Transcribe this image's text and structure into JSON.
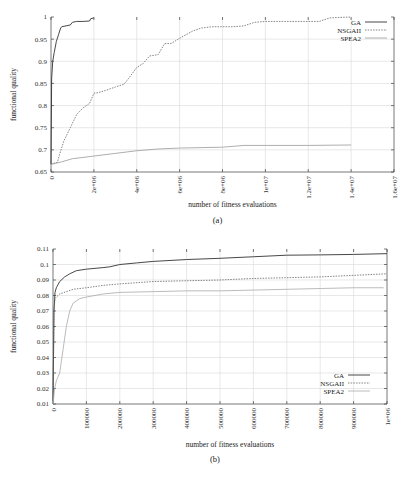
{
  "chart_data": [
    {
      "type": "line",
      "panel": "(a)",
      "caption": "(a)",
      "title": "",
      "xlabel": "number of fitness evaluations",
      "ylabel": "functional quality",
      "xlim": [
        0,
        16000000
      ],
      "ylim": [
        0.65,
        1.0
      ],
      "grid": true,
      "legend": "top-right",
      "x_ticks": [
        0,
        2000000,
        4000000,
        6000000,
        8000000,
        10000000,
        12000000,
        14000000,
        16000000
      ],
      "x_tick_labels": [
        "0",
        "2e+06",
        "4e+06",
        "6e+06",
        "8e+06",
        "1e+07",
        "1.2e+07",
        "1.4e+07",
        "1.6e+07"
      ],
      "y_ticks": [
        0.65,
        0.7,
        0.75,
        0.8,
        0.85,
        0.9,
        0.95,
        1.0
      ],
      "y_tick_labels": [
        "0.65",
        "0.7",
        "0.75",
        "0.8",
        "0.85",
        "0.9",
        "0.95",
        "1"
      ],
      "series": [
        {
          "name": "GA",
          "style": "solid",
          "color": "#333333",
          "x": [
            0,
            30000,
            80000,
            150000,
            250000,
            350000,
            450000,
            500000,
            700000,
            900000,
            1000000,
            1200000,
            1500000,
            1800000,
            1850000,
            2000000
          ],
          "y": [
            0.668,
            0.86,
            0.9,
            0.92,
            0.945,
            0.96,
            0.975,
            0.978,
            0.98,
            0.982,
            0.988,
            0.99,
            0.99,
            0.991,
            0.996,
            0.998
          ]
        },
        {
          "name": "NSGAII",
          "style": "dashed",
          "color": "#666666",
          "x": [
            0,
            300000,
            400000,
            600000,
            900000,
            1200000,
            1500000,
            1800000,
            2000000,
            2200000,
            2600000,
            3000000,
            3400000,
            3600000,
            4000000,
            4300000,
            4600000,
            5000000,
            5300000,
            5600000,
            6000000,
            6300000,
            6600000,
            7000000,
            7500000,
            8000000,
            8500000,
            9000000,
            9500000,
            10000000,
            12000000,
            12500000,
            13000000,
            14000000
          ],
          "y": [
            0.668,
            0.672,
            0.69,
            0.72,
            0.75,
            0.78,
            0.795,
            0.805,
            0.828,
            0.829,
            0.835,
            0.842,
            0.848,
            0.86,
            0.886,
            0.895,
            0.912,
            0.915,
            0.94,
            0.94,
            0.952,
            0.96,
            0.968,
            0.975,
            0.978,
            0.978,
            0.978,
            0.98,
            0.988,
            0.99,
            0.99,
            0.99,
            0.998,
            1.0
          ]
        },
        {
          "name": "SPEA2",
          "style": "solid-light",
          "color": "#999999",
          "x": [
            0,
            500000,
            1000000,
            2000000,
            3000000,
            4000000,
            5000000,
            6000000,
            7000000,
            8000000,
            8500000,
            9000000,
            10000000,
            12000000,
            14000000
          ],
          "y": [
            0.667,
            0.673,
            0.68,
            0.686,
            0.692,
            0.698,
            0.702,
            0.704,
            0.705,
            0.706,
            0.708,
            0.71,
            0.71,
            0.71,
            0.711
          ]
        }
      ]
    },
    {
      "type": "line",
      "panel": "(b)",
      "caption": "(b)",
      "title": "",
      "xlabel": "number of fitness evaluations",
      "ylabel": "functional quality",
      "xlim": [
        0,
        1000000
      ],
      "ylim": [
        0.01,
        0.11
      ],
      "grid": true,
      "legend": "bottom-right",
      "x_ticks": [
        0,
        100000,
        200000,
        300000,
        400000,
        500000,
        600000,
        700000,
        800000,
        900000,
        1000000
      ],
      "x_tick_labels": [
        "0",
        "100000",
        "200000",
        "300000",
        "400000",
        "500000",
        "600000",
        "700000",
        "800000",
        "900000",
        "1e+06"
      ],
      "y_ticks": [
        0.01,
        0.02,
        0.03,
        0.04,
        0.05,
        0.06,
        0.07,
        0.08,
        0.09,
        0.1,
        0.11
      ],
      "y_tick_labels": [
        "0.01",
        "0.02",
        "0.03",
        "0.04",
        "0.05",
        "0.06",
        "0.07",
        "0.08",
        "0.09",
        "0.1",
        "0.11"
      ],
      "series": [
        {
          "name": "GA",
          "style": "solid",
          "color": "#333333",
          "x": [
            0,
            3000,
            6000,
            10000,
            20000,
            35000,
            50000,
            70000,
            100000,
            150000,
            170000,
            200000,
            250000,
            300000,
            400000,
            500000,
            600000,
            700000,
            800000,
            900000,
            1000000
          ],
          "y": [
            0.012,
            0.07,
            0.082,
            0.085,
            0.089,
            0.092,
            0.094,
            0.096,
            0.097,
            0.098,
            0.0985,
            0.1,
            0.101,
            0.102,
            0.1032,
            0.104,
            0.105,
            0.106,
            0.1062,
            0.1065,
            0.107
          ]
        },
        {
          "name": "NSGAII",
          "style": "dashed",
          "color": "#666666",
          "x": [
            0,
            3000,
            6000,
            10000,
            20000,
            40000,
            60000,
            100000,
            150000,
            200000,
            300000,
            400000,
            500000,
            600000,
            700000,
            800000,
            900000,
            1000000
          ],
          "y": [
            0.012,
            0.07,
            0.078,
            0.079,
            0.081,
            0.0825,
            0.084,
            0.085,
            0.0865,
            0.0875,
            0.089,
            0.0895,
            0.09,
            0.091,
            0.0915,
            0.092,
            0.093,
            0.094
          ]
        },
        {
          "name": "SPEA2",
          "style": "solid-light",
          "color": "#aaaaaa",
          "x": [
            0,
            5000,
            10000,
            20000,
            30000,
            40000,
            50000,
            60000,
            80000,
            100000,
            150000,
            200000,
            300000,
            400000,
            500000,
            600000,
            700000,
            800000,
            900000,
            990000
          ],
          "y": [
            0.01,
            0.02,
            0.025,
            0.03,
            0.045,
            0.06,
            0.07,
            0.075,
            0.078,
            0.079,
            0.081,
            0.082,
            0.0825,
            0.083,
            0.083,
            0.0835,
            0.084,
            0.0845,
            0.085,
            0.085
          ]
        }
      ]
    }
  ]
}
